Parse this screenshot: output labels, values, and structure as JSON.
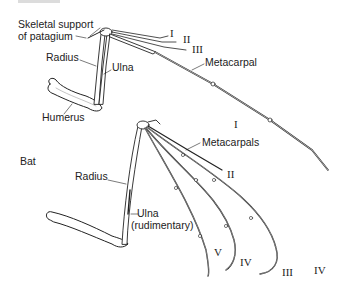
{
  "figure": {
    "top_title_cut_off": "",
    "pterosaur": {
      "labels": {
        "skeletal_support_line1": "Skeletal support",
        "skeletal_support_line2": "of patagium",
        "digit_1": "I",
        "digit_2": "II",
        "digit_3": "III",
        "metacarpal": "Metacarpal",
        "radius": "Radius",
        "ulna": "Ulna",
        "humerus": "Humerus",
        "digit_4": "IV"
      }
    },
    "bat": {
      "title": "Bat",
      "labels": {
        "digit_1": "I",
        "metacarpals": "Metacarpals",
        "digit_2": "II",
        "radius": "Radius",
        "ulna_line1": "Ulna",
        "ulna_line2": "(rudimentary)",
        "digit_5": "V",
        "digit_4": "IV",
        "digit_3": "III"
      }
    },
    "colors": {
      "ink": "#222222",
      "bone_fill": "#ffffff",
      "background": "#ffffff"
    }
  }
}
